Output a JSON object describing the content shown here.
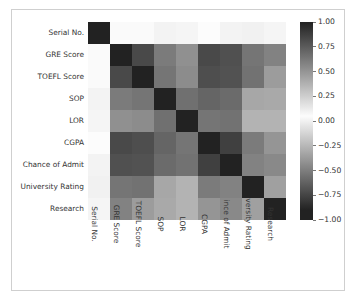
{
  "chart_data": {
    "type": "heatmap",
    "title": "",
    "xlabel": "",
    "ylabel": "",
    "colormap": "gray-diverging",
    "grid": false,
    "legend_position": "right",
    "categories": [
      "Serial No.",
      "GRE Score",
      "TOEFL Score",
      "SOP",
      "LOR",
      "CGPA",
      "Chance of Admit",
      "University Rating",
      "Research"
    ],
    "x_tick_labels": [
      "Serial No.",
      "GRE Score",
      "TOEFL Score",
      "SOP",
      "LOR",
      "CGPA",
      "ince of Admit",
      "versity Rating",
      "Research"
    ],
    "y_tick_labels": [
      "Serial No.",
      "GRE Score",
      "TOEFL Score",
      "SOP",
      "LOR",
      "CGPA",
      "Chance of Admit",
      "University Rating",
      "Research"
    ],
    "matrix": [
      [
        1.0,
        0.06,
        0.04,
        0.01,
        0.02,
        0.05,
        0.01,
        0.0,
        0.02
      ],
      [
        0.06,
        1.0,
        0.83,
        0.61,
        0.52,
        0.83,
        0.8,
        0.64,
        0.58
      ],
      [
        0.04,
        0.83,
        1.0,
        0.64,
        0.54,
        0.81,
        0.79,
        0.65,
        0.47
      ],
      [
        0.01,
        0.61,
        0.64,
        1.0,
        0.66,
        0.71,
        0.68,
        0.42,
        0.41
      ],
      [
        0.02,
        0.52,
        0.54,
        0.66,
        1.0,
        0.64,
        0.65,
        0.37,
        0.37
      ],
      [
        0.05,
        0.83,
        0.81,
        0.71,
        0.64,
        1.0,
        0.87,
        0.61,
        0.5
      ],
      [
        0.01,
        0.8,
        0.79,
        0.68,
        0.65,
        0.87,
        1.0,
        0.58,
        0.55
      ],
      [
        0.0,
        0.64,
        0.65,
        0.42,
        0.37,
        0.61,
        0.58,
        1.0,
        0.45
      ],
      [
        0.02,
        0.58,
        0.47,
        0.41,
        0.37,
        0.5,
        0.55,
        0.45,
        1.0
      ]
    ],
    "colorbar": {
      "ticks": [
        "1.00",
        "0.75",
        "0.50",
        "0.25",
        "0.00",
        "-0.25",
        "-0.50",
        "-0.75",
        "-1.00"
      ],
      "tick_values": [
        1.0,
        0.75,
        0.5,
        0.25,
        0.0,
        -0.25,
        -0.5,
        -0.75,
        -1.0
      ],
      "vmin": -1.0,
      "vmax": 1.0
    }
  }
}
